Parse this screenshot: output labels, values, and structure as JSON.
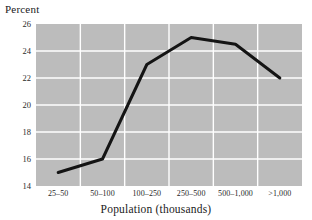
{
  "chart_data": {
    "type": "line",
    "title": "",
    "subtitle": "",
    "ylabel": "Percent",
    "xlabel": "Population (thousands)",
    "categories": [
      "25–50",
      "50–100",
      "100–250",
      "250–500",
      "500–1,000",
      ">1,000"
    ],
    "values": [
      15.0,
      16.0,
      23.0,
      25.0,
      24.5,
      22.0
    ],
    "series": [
      {
        "name": "Percent",
        "values": [
          15.0,
          16.0,
          23.0,
          25.0,
          24.5,
          22.0
        ]
      }
    ],
    "ylim": [
      14,
      26
    ],
    "yticks": [
      14,
      16,
      18,
      20,
      22,
      24,
      26
    ],
    "ytick_labels": [
      "14",
      "16",
      "18",
      "20",
      "22",
      "24",
      "26"
    ],
    "grid": true,
    "grid_color": "#ffffff",
    "legend": false,
    "legend_position": "none",
    "plot_background": "#bcbcbc",
    "line_color": "#141414",
    "line_width": 3,
    "page_background": "#ffffff"
  }
}
